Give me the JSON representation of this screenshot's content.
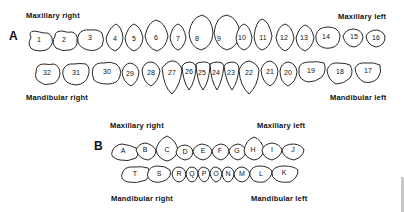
{
  "panel_a": {
    "letter": "A",
    "labels": {
      "maxillary_right": "Maxillary right",
      "maxillary_left": "Maxillary left",
      "mandibular_right": "Mandibular right",
      "mandibular_left": "Mandibular left"
    },
    "upper_teeth": [
      "1",
      "2",
      "3",
      "4",
      "5",
      "6",
      "7",
      "8",
      "9",
      "10",
      "11",
      "12",
      "13",
      "14",
      "15",
      "16"
    ],
    "lower_teeth": [
      "32",
      "31",
      "30",
      "29",
      "28",
      "27",
      "26",
      "25",
      "24",
      "23",
      "22",
      "21",
      "20",
      "19",
      "18",
      "17"
    ]
  },
  "panel_b": {
    "letter": "B",
    "labels": {
      "maxillary_right": "Maxillary right",
      "maxillary_left": "Maxillary left",
      "mandibular_right": "Mandibular right",
      "mandibular_left": "Mandibular left"
    },
    "upper_teeth": [
      "A",
      "B",
      "C",
      "D",
      "E",
      "F",
      "G",
      "H",
      "I",
      "J"
    ],
    "lower_teeth": [
      "T",
      "S",
      "R",
      "Q",
      "P",
      "O",
      "N",
      "M",
      "L",
      "K"
    ]
  }
}
